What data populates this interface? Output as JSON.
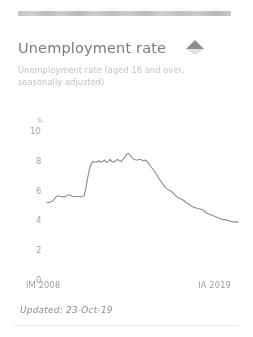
{
  "card": {
    "title": "Unemployment rate",
    "subtitle": "Unemployment rate (aged 16 and over, seasonally adjusted)",
    "trend_icon": "triangle-up-icon",
    "trend_color": "#8e8e8e",
    "footer": "Updated: 23-Oct-19"
  },
  "chart_data": {
    "type": "line",
    "title": "Unemployment rate",
    "subtitle": "Unemployment rate (aged 16 and over, seasonally adjusted)",
    "xlabel": "",
    "ylabel": "%",
    "unit_label": "%",
    "xlim": [
      "IM 2008",
      "IA 2019"
    ],
    "x_tick_labels": [
      "IM 2008",
      "IA 2019"
    ],
    "ylim": [
      0,
      10
    ],
    "y_ticks": [
      0,
      2,
      4,
      6,
      8,
      10
    ],
    "y_tick_labels": [
      "0",
      "2",
      "4",
      "6",
      "8",
      "10"
    ],
    "grid": false,
    "legend": "none",
    "line_color": "#8c8c8c",
    "series": [
      {
        "name": "Unemployment rate",
        "values": [
          5.2,
          5.2,
          5.25,
          5.3,
          5.45,
          5.6,
          5.65,
          5.62,
          5.6,
          5.58,
          5.6,
          5.7,
          5.7,
          5.65,
          5.6,
          5.6,
          5.6,
          5.6,
          5.58,
          5.6,
          5.65,
          6.2,
          6.9,
          7.5,
          7.85,
          7.95,
          7.92,
          7.9,
          8.0,
          7.9,
          7.95,
          8.05,
          7.9,
          7.95,
          8.1,
          7.95,
          7.9,
          8.0,
          8.1,
          8.0,
          7.95,
          8.1,
          8.25,
          8.45,
          8.5,
          8.35,
          8.2,
          8.1,
          8.05,
          8.05,
          8.1,
          8.05,
          8.0,
          8.05,
          7.95,
          7.8,
          7.6,
          7.45,
          7.3,
          7.1,
          6.9,
          6.7,
          6.5,
          6.35,
          6.2,
          6.1,
          6.0,
          5.95,
          5.85,
          5.7,
          5.6,
          5.5,
          5.45,
          5.4,
          5.3,
          5.2,
          5.15,
          5.05,
          4.95,
          4.9,
          4.85,
          4.8,
          4.78,
          4.75,
          4.7,
          4.6,
          4.5,
          4.45,
          4.4,
          4.35,
          4.3,
          4.25,
          4.2,
          4.15,
          4.1,
          4.05,
          4.05,
          4.0,
          4.0,
          3.95,
          3.9,
          3.9,
          3.9,
          3.9
        ]
      }
    ]
  }
}
